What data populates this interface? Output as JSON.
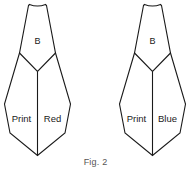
{
  "figure": {
    "caption": "Fig. 2",
    "line_color": "#1a1a1a",
    "background_color": "#ffffff",
    "shapes": [
      {
        "id": "left-pattern-piece",
        "neck_label": "B",
        "left_panel_label": "Print",
        "right_panel_label": "Red"
      },
      {
        "id": "right-pattern-piece",
        "neck_label": "B",
        "left_panel_label": "Print",
        "right_panel_label": "Blue"
      }
    ]
  }
}
